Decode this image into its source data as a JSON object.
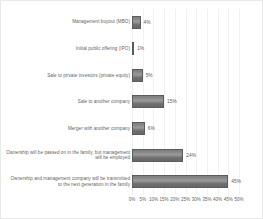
{
  "chart_data": {
    "type": "bar",
    "orientation": "horizontal",
    "title": "",
    "xlabel": "",
    "ylabel": "",
    "xlim": [
      0,
      50
    ],
    "xtick_step": 5,
    "grid": true,
    "legend": false,
    "value_suffix": "%",
    "bar_color": "#7e7e7e",
    "bar_border_color": "#5c5c5c",
    "gridline_color": "#f2f2f2",
    "text_color": "#5f5f5f",
    "border_color": "#e9e9e9",
    "xticks": [
      "0%",
      "5%",
      "10%",
      "15%",
      "20%",
      "25%",
      "30%",
      "35%",
      "40%",
      "45%",
      "50%"
    ],
    "categories": [
      "Management buyout (MBO)",
      "Initial public offering (IPO)",
      "Sale to private investors (private equity)",
      "Sale to another company",
      "Merger with another company",
      "Ownership will be passed on in the family, but management will be employed",
      "Ownership and management company will be transmitted to the next generation in the family"
    ],
    "values": [
      4,
      1,
      5,
      15,
      6,
      24,
      45
    ],
    "value_labels": [
      "4%",
      "1%",
      "5%",
      "15%",
      "6%",
      "24%",
      "45%"
    ]
  }
}
